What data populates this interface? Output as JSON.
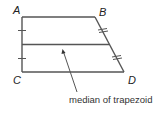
{
  "diagram": {
    "type": "trapezoid-median",
    "vertices": {
      "A": {
        "label": "A"
      },
      "B": {
        "label": "B"
      },
      "C": {
        "label": "C"
      },
      "D": {
        "label": "D"
      }
    },
    "caption": "median of trapezoid",
    "colors": {
      "line": "#555555",
      "text": "#222222",
      "background": "#ffffff"
    }
  }
}
